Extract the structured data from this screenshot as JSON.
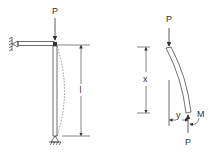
{
  "left_figure": {
    "load_label": "P",
    "length_label": "l"
  },
  "right_figure": {
    "top_load_label": "P",
    "bottom_load_label": "P",
    "x_label": "x",
    "y_label": "y",
    "moment_label": "M"
  },
  "colors": {
    "line": "#333333",
    "background": "#ffffff"
  }
}
